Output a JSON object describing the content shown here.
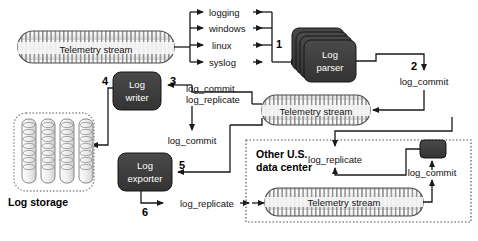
{
  "diagram": {
    "colors": {
      "node_fill": "#3d3d3d",
      "node_text": "#ffffff",
      "line": "#1a1a1a",
      "stream_fill": "#f2f2f2",
      "stream_stroke": "#4a4a4a",
      "background": "#ffffff"
    },
    "nodes": {
      "stream_main": "Telemetry stream",
      "stream_mid": "Telemetry stream",
      "stream_dc": "Telemetry stream",
      "log_parser_line1": "Log",
      "log_parser_line2": "parser",
      "log_writer_line1": "Log",
      "log_writer_line2": "writer",
      "log_exporter_line1": "Log",
      "log_exporter_line2": "exporter",
      "log_storage": "Log storage",
      "data_center_line1": "Other U.S.",
      "data_center_line2": "data center"
    },
    "sources": [
      "logging",
      "windows",
      "linux",
      "syslog"
    ],
    "steps": [
      "1",
      "2",
      "3",
      "4",
      "5",
      "6"
    ],
    "edge_labels": {
      "commit_replicate_line1": "log_commit",
      "commit_replicate_line2": "log_replicate",
      "commit_to_writer": "log_commit",
      "commit_to_exporter": "log_commit",
      "replicate_out": "log_replicate",
      "replicate_dc": "log_replicate",
      "commit_dc": "log_commit"
    }
  }
}
